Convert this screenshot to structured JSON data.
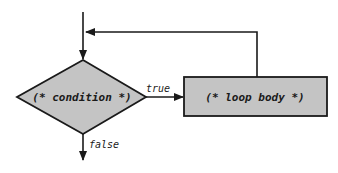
{
  "diagram": {
    "type": "flowchart-while-loop",
    "colors": {
      "stroke": "#1a1a1a",
      "shape_fill": "#c4c4c4",
      "background": "#ffffff"
    },
    "nodes": {
      "condition": {
        "shape": "diamond",
        "label": "(* condition *)"
      },
      "loop_body": {
        "shape": "rectangle",
        "label": "(* loop body *)"
      }
    },
    "edges": {
      "entry": {
        "from": "top",
        "to": "condition",
        "label": ""
      },
      "true_branch": {
        "from": "condition",
        "to": "loop_body",
        "label": "true"
      },
      "false_branch": {
        "from": "condition",
        "to": "exit",
        "label": "false"
      },
      "loop_back": {
        "from": "loop_body",
        "to": "entry",
        "label": ""
      }
    }
  }
}
